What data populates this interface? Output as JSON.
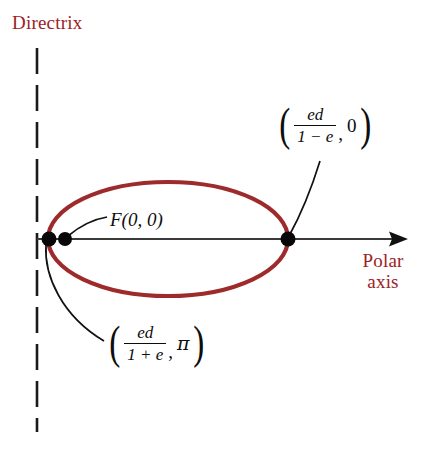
{
  "figure": {
    "type": "geometry-diagram",
    "width": 425,
    "height": 449,
    "background": "#ffffff"
  },
  "colors": {
    "accent_red": "#9B2226",
    "curve_red": "#9E2B2B",
    "axis_gray": "#3a3a3a",
    "ink_black": "#0d0d0d"
  },
  "labels": {
    "directrix": "Directrix",
    "polar_axis_line1": "Polar",
    "polar_axis_line2": "axis",
    "focus": "F(0, 0)"
  },
  "upper_coord": {
    "numerator": "ed",
    "denominator": "1 − e",
    "second": "0",
    "open_paren": "(",
    "close_paren": ")",
    "comma": ","
  },
  "lower_coord": {
    "numerator": "ed",
    "denominator": "1 + e",
    "second": "π",
    "open_paren": "(",
    "close_paren": ")",
    "comma": ","
  },
  "geometry": {
    "directrix_x": 37,
    "directrix_top": 48,
    "directrix_bottom": 432,
    "axis_y": 239,
    "axis_start_x": 37,
    "axis_arrow_x": 408,
    "ellipse_center_x": 168,
    "ellipse_center_y": 239,
    "ellipse_rx": 120,
    "ellipse_ry": 57,
    "point_left_vertex_x": 49,
    "point_focus_x": 65,
    "point_right_vertex_x": 288,
    "point_radius": 7
  }
}
